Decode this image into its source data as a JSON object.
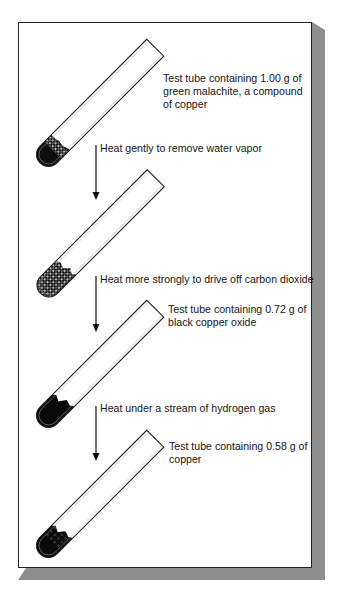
{
  "figure": {
    "type": "process-diagram",
    "stages": [
      {
        "id": "tube-1",
        "label_lines": [
          "Test tube containing 1.00 g of",
          "green malachite, a compound",
          "of copper"
        ],
        "mass_g": 1.0,
        "substance": "green malachite"
      },
      {
        "id": "tube-2",
        "label_lines": [],
        "substance": "dehydrated malachite"
      },
      {
        "id": "tube-3",
        "label_lines": [
          "Test tube containing 0.72 g of",
          "black copper oxide"
        ],
        "mass_g": 0.72,
        "substance": "black copper oxide"
      },
      {
        "id": "tube-4",
        "label_lines": [
          "Test tube containing 0.58 g of",
          "copper"
        ],
        "mass_g": 0.58,
        "substance": "copper"
      }
    ],
    "steps": [
      {
        "id": "step-1",
        "text": "Heat gently to remove water vapor"
      },
      {
        "id": "step-2",
        "text": "Heat more strongly to drive off carbon dioxide"
      },
      {
        "id": "step-3",
        "text": "Heat under a stream of hydrogen gas"
      }
    ],
    "colors": {
      "outline": "#222222",
      "fill_dark": "#0d0d0d",
      "shadow": "#8e8e8e",
      "background": "#ffffff"
    }
  }
}
